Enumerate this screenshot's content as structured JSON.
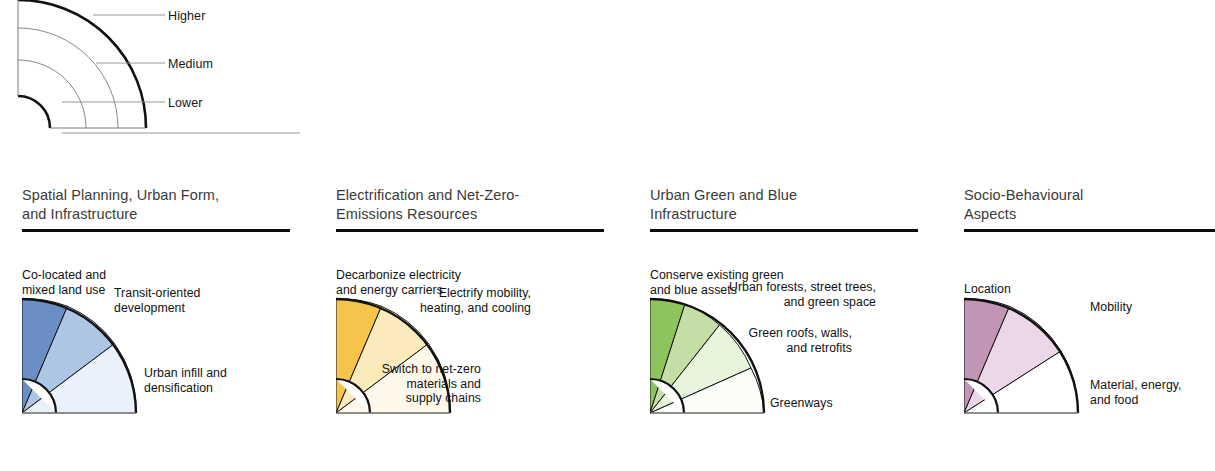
{
  "legend": {
    "name": "priority-legend",
    "rings": [
      {
        "id": "higher",
        "label": "Higher"
      },
      {
        "id": "medium",
        "label": "Medium"
      },
      {
        "id": "lower",
        "label": "Lower"
      }
    ]
  },
  "panels": [
    {
      "id": "spatial-planning",
      "title": "Spatial Planning, Urban Form,\nand Infrastructure",
      "accent": "#6b8fc4",
      "wedges": [
        {
          "label": "Co-located and\nmixed land use",
          "color": "#6b8fc4"
        },
        {
          "label": "Transit-oriented\ndevelopment",
          "color": "#adc6e6"
        },
        {
          "label": "Urban infill and\ndensification",
          "color": "#eaf1fa"
        }
      ]
    },
    {
      "id": "electrification",
      "title": "Electrification and Net-Zero-\nEmissions Resources",
      "accent": "#f6c84c",
      "wedges": [
        {
          "label": "Decarbonize electricity\nand energy carriers",
          "color": "#f6c44a"
        },
        {
          "label": "Electrify mobility,\nheating, and cooling",
          "color": "#fbeabc"
        },
        {
          "label": "Switch to net-zero\nmaterials and\nsupply chains",
          "color": "#fdf8ea"
        }
      ]
    },
    {
      "id": "green-blue-infrastructure",
      "title": "Urban Green and Blue\nInfrastructure",
      "accent": "#8fc45c",
      "wedges": [
        {
          "label": "Conserve existing green\nand blue assets",
          "color": "#8dc45c"
        },
        {
          "label": "Urban forests, street trees,\nand green space",
          "color": "#c4dfa6"
        },
        {
          "label": "Green roofs, walls,\nand retrofits",
          "color": "#e9f4dd"
        },
        {
          "label": "Greenways",
          "color": "#fbfdf8"
        }
      ]
    },
    {
      "id": "socio-behavioural",
      "title": "Socio-Behavioural\nAspects",
      "accent": "#c295b4",
      "wedges": [
        {
          "label": "Location",
          "color": "#c295b4"
        },
        {
          "label": "Mobility",
          "color": "#ecd7e8"
        },
        {
          "label": "Material, energy,\nand food",
          "color": "#ffffff"
        }
      ]
    }
  ],
  "colors": {
    "rule": "#0b0b0b",
    "stroke": "#111111",
    "title_text": "#3a3a3a",
    "body_text": "#121212",
    "leader_line": "#8d8d8d"
  }
}
